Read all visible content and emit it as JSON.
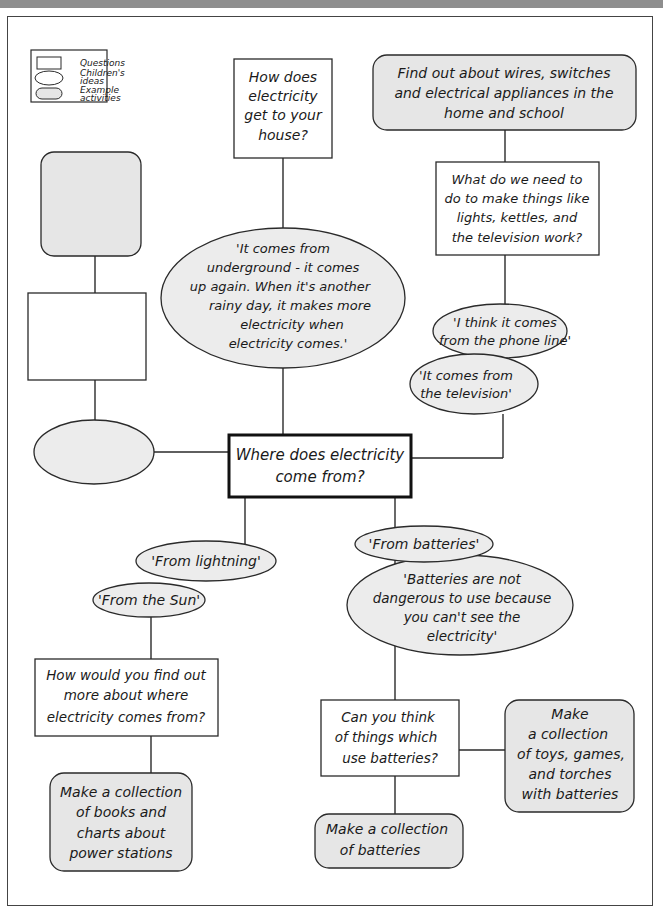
{
  "colors": {
    "banner": "#8e8e8e",
    "stroke": "#2a2a2a",
    "question_fill": "#ffffff",
    "idea_fill": "#ececec",
    "activity_fill": "#e6e6e6"
  },
  "legend": {
    "items": [
      {
        "shape": "rectangle",
        "label": "Questions"
      },
      {
        "shape": "ellipse",
        "label_lines": [
          "Children's",
          "ideas"
        ]
      },
      {
        "shape": "rounded-rectangle",
        "label_lines": [
          "Example",
          "activities"
        ]
      }
    ]
  },
  "central": {
    "lines": [
      "Where does electricity",
      "come from?"
    ]
  },
  "nodes": {
    "q_house": {
      "type": "question",
      "lines": [
        "How does",
        "electricity",
        "get to your",
        "house?"
      ]
    },
    "idea_underground": {
      "type": "idea",
      "lines": [
        "'It comes from",
        "underground - it comes",
        "up again. When it's another",
        "rainy day, it makes more",
        "electricity when",
        "electricity comes.'"
      ]
    },
    "act_wires": {
      "type": "activity",
      "lines": [
        "Find out about wires, switches",
        "and electrical appliances in the",
        "home and school"
      ]
    },
    "q_need": {
      "type": "question",
      "lines": [
        "What do we need to",
        "do to make things like",
        "lights, kettles, and",
        "the television work?"
      ]
    },
    "idea_phone": {
      "type": "idea",
      "lines": [
        "'I think it comes",
        "from the phone line'"
      ]
    },
    "idea_tv": {
      "type": "idea",
      "lines": [
        "'It comes from",
        "the television'"
      ]
    },
    "blank_activity": {
      "type": "activity",
      "lines": []
    },
    "blank_question": {
      "type": "question",
      "lines": []
    },
    "blank_idea": {
      "type": "idea",
      "lines": []
    },
    "idea_lightning": {
      "type": "idea",
      "lines": [
        "'From lightning'"
      ]
    },
    "idea_sun": {
      "type": "idea",
      "lines": [
        "'From the Sun'"
      ]
    },
    "q_find_out": {
      "type": "question",
      "lines": [
        "How would you find out",
        "more about where",
        "electricity comes from?"
      ]
    },
    "act_books": {
      "type": "activity",
      "lines": [
        "Make a collection",
        "of books and",
        "charts about",
        "power stations"
      ]
    },
    "idea_batteries": {
      "type": "idea",
      "lines": [
        "'From batteries'"
      ]
    },
    "idea_not_dangerous": {
      "type": "idea",
      "lines": [
        "'Batteries are not",
        "dangerous to use because",
        "you can't see the",
        "electricity'"
      ]
    },
    "q_think": {
      "type": "question",
      "lines": [
        "Can you think",
        "of things which",
        "use batteries?"
      ]
    },
    "act_toys": {
      "type": "activity",
      "lines": [
        "Make",
        "a collection",
        "of toys, games,",
        "and torches",
        "with batteries"
      ]
    },
    "act_batteries": {
      "type": "activity",
      "lines": [
        "Make a collection",
        "of batteries"
      ]
    }
  }
}
